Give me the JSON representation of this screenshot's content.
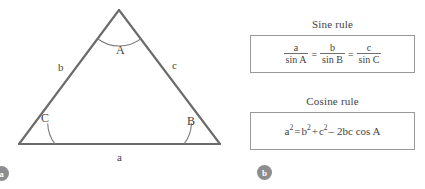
{
  "figure": {
    "panels": [
      {
        "id": "a",
        "badge_label": "a",
        "caption": "triangle-diagram"
      },
      {
        "id": "b",
        "badge_label": "b",
        "caption": "trigonometric-rules"
      }
    ]
  },
  "triangle": {
    "side_labels": {
      "a": "a",
      "b": "b",
      "c": "c"
    },
    "angle_labels": {
      "A": "A",
      "B": "B",
      "C": "C"
    },
    "stroke_color": "#6b6b6b",
    "arc_color": "#7a7a7a",
    "vertices": {
      "apex": [
        119,
        10
      ],
      "bottom_left": [
        19,
        144
      ],
      "bottom_right": [
        220,
        144
      ]
    }
  },
  "rules": {
    "sine": {
      "title": "Sine rule",
      "fractions": [
        {
          "numerator": "a",
          "denominator": "sin A"
        },
        {
          "numerator": "b",
          "denominator": "sin B"
        },
        {
          "numerator": "c",
          "denominator": "sin C"
        }
      ],
      "equals": "=",
      "plain_text": "a / sin A = b / sin B = c / sin C"
    },
    "cosine": {
      "title": "Cosine rule",
      "lhs_base": "a",
      "lhs_exp": "2",
      "equals": "=",
      "term1_base": "b",
      "term1_exp": "2",
      "plus": "+",
      "term2_base": "c",
      "term2_exp": "2",
      "minus": "–",
      "term3": "2bc cos A",
      "plain_text": "a² = b² + c² – 2bc cos A"
    }
  },
  "colors": {
    "background": "#ffffff",
    "line": "#6b6b6b",
    "box_border": "#9a9a9a",
    "text": "#3f3f3f",
    "badge_fill": "#8d8d8d",
    "badge_text": "#ffffff"
  }
}
